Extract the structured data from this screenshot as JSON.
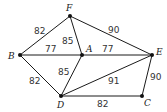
{
  "graph": {
    "nodes": [
      {
        "id": "F",
        "label": "F",
        "x": 70,
        "y": 16,
        "lx": 66,
        "ly": 11
      },
      {
        "id": "B",
        "label": "B",
        "x": 20,
        "y": 55,
        "lx": 8,
        "ly": 59
      },
      {
        "id": "A",
        "label": "A",
        "x": 82,
        "y": 55,
        "lx": 86,
        "ly": 52
      },
      {
        "id": "E",
        "label": "E",
        "x": 152,
        "y": 55,
        "lx": 156,
        "ly": 55
      },
      {
        "id": "D",
        "label": "D",
        "x": 61,
        "y": 96,
        "lx": 57,
        "ly": 108
      },
      {
        "id": "C",
        "label": "C",
        "x": 142,
        "y": 96,
        "lx": 144,
        "ly": 106
      }
    ],
    "edges": [
      {
        "from": "F",
        "to": "B",
        "weight": "82",
        "lx": 34,
        "ly": 34
      },
      {
        "from": "F",
        "to": "A",
        "weight": "85",
        "lx": 62,
        "ly": 44
      },
      {
        "from": "F",
        "to": "E",
        "weight": "90",
        "lx": 108,
        "ly": 33
      },
      {
        "from": "B",
        "to": "A",
        "weight": "77",
        "lx": 45,
        "ly": 52
      },
      {
        "from": "A",
        "to": "E",
        "weight": "77",
        "lx": 102,
        "ly": 52
      },
      {
        "from": "B",
        "to": "D",
        "weight": "82",
        "lx": 29,
        "ly": 84
      },
      {
        "from": "A",
        "to": "D",
        "weight": "85",
        "lx": 58,
        "ly": 75
      },
      {
        "from": "D",
        "to": "E",
        "weight": "91",
        "lx": 108,
        "ly": 84
      },
      {
        "from": "E",
        "to": "C",
        "weight": "90",
        "lx": 150,
        "ly": 80
      },
      {
        "from": "D",
        "to": "C",
        "weight": "82",
        "lx": 97,
        "ly": 107
      }
    ]
  }
}
